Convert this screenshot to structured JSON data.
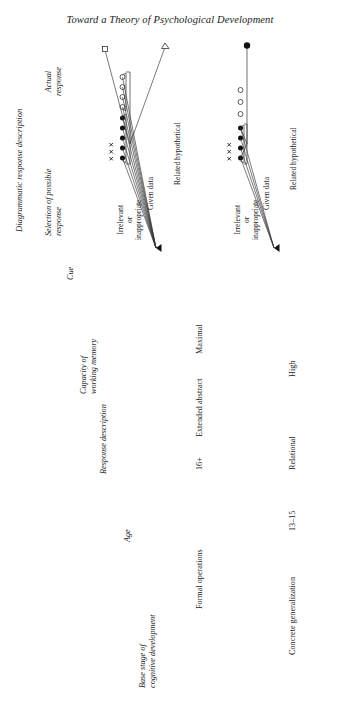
{
  "page": {
    "title": "Toward a Theory of Psychological Development",
    "figure_caption": "Diagrammatic response description"
  },
  "columns": [
    {
      "id": "base-stage",
      "label": "Base stage of\ncognitive development",
      "line1": "Base stage of",
      "line2": "cognitive development"
    },
    {
      "id": "age",
      "label": "Age",
      "line1": "Age",
      "line2": ""
    },
    {
      "id": "response-description",
      "label": "Response description",
      "line1": "Response description",
      "line2": ""
    },
    {
      "id": "capacity",
      "label": "Capacity of\nworking memory",
      "line1": "Capacity of",
      "line2": "working memory"
    },
    {
      "id": "cue",
      "label": "Cue",
      "line1": "Cue",
      "line2": ""
    },
    {
      "id": "selection",
      "label": "Selection of possible\nresponse",
      "line1": "Selection of possible",
      "line2": "response"
    },
    {
      "id": "actual",
      "label": "Actual\nresponse",
      "line1": "Actual",
      "line2": "response"
    }
  ],
  "rows": [
    {
      "id": "formal-operations",
      "base_stage": "Formal operations",
      "age": "16+",
      "response_description": "Extended abstract",
      "capacity": "Maximal",
      "brackets": [
        {
          "id": "irrelevant",
          "line1": "Irrelevant",
          "line2": "or",
          "line3": "inappropriate"
        },
        {
          "id": "given-data",
          "line1": "Given data",
          "line2": "",
          "line3": ""
        },
        {
          "id": "related-hypothetical",
          "line1": "Related hypothetical",
          "line2": "",
          "line3": ""
        }
      ],
      "symbols": {
        "crosses": 3,
        "filled_circles": 5,
        "open_circles": 4
      },
      "actual_response_markers": [
        "square",
        "triangle"
      ]
    },
    {
      "id": "concrete-generalization",
      "base_stage": "Concrete generalization",
      "age": "13–15",
      "response_description": "Relational",
      "capacity": "High",
      "brackets": [
        {
          "id": "irrelevant",
          "line1": "Irrelevant",
          "line2": "or",
          "line3": "inappropriate"
        },
        {
          "id": "given-data",
          "line1": "Given data",
          "line2": "",
          "line3": ""
        },
        {
          "id": "related-hypothetical",
          "line1": "Related hypothetical",
          "line2": "",
          "line3": ""
        }
      ],
      "symbols": {
        "crosses": 3,
        "filled_circles": 4,
        "open_circles": 3
      },
      "actual_response_markers": [
        "filled-circle"
      ]
    }
  ],
  "colors": {
    "ink": "#1a1a1a",
    "line": "#333333",
    "paper": "#ffffff"
  }
}
